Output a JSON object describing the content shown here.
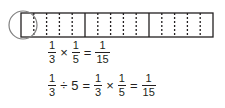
{
  "diagram": {
    "thirds": 3,
    "fifths_per_third": 5,
    "circled_part": "1/15",
    "colors": {
      "line": "#231f20",
      "dotted": "#231f20",
      "circle": "#808080"
    }
  },
  "equation1": {
    "a": {
      "num": "1",
      "den": "3"
    },
    "op1": "×",
    "b": {
      "num": "1",
      "den": "5"
    },
    "eq": "=",
    "result": {
      "num": "1",
      "den": "15"
    }
  },
  "equation2": {
    "a": {
      "num": "1",
      "den": "3"
    },
    "op1": "÷",
    "whole": "5",
    "eq1": "=",
    "b": {
      "num": "1",
      "den": "3"
    },
    "op2": "×",
    "c": {
      "num": "1",
      "den": "5"
    },
    "eq2": "=",
    "result": {
      "num": "1",
      "den": "15"
    }
  }
}
